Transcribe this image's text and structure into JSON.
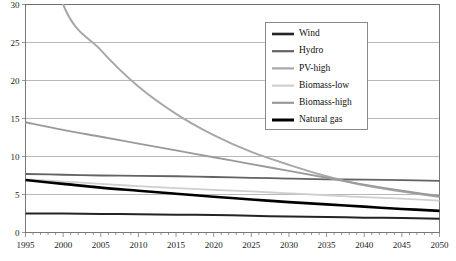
{
  "chart_data": {
    "type": "line",
    "title": "",
    "subtitle": "",
    "xlabel": "",
    "ylabel": "",
    "xlim": [
      1995,
      2050
    ],
    "ylim": [
      0,
      30
    ],
    "y_ticks": [
      0,
      5,
      10,
      15,
      20,
      25,
      30
    ],
    "x_ticks": [
      1995,
      2000,
      2005,
      2010,
      2015,
      2020,
      2025,
      2030,
      2035,
      2040,
      2045,
      2050
    ],
    "x_minor_tick_step": 1,
    "grid": "horizontal",
    "legend_position": "top-right",
    "x": [
      1995,
      2000,
      2005,
      2010,
      2015,
      2020,
      2025,
      2030,
      2035,
      2040,
      2045,
      2050
    ],
    "series": [
      {
        "name": "Wind",
        "color": "#242424",
        "width": 2.0,
        "values": [
          2.5,
          2.5,
          2.45,
          2.4,
          2.35,
          2.3,
          2.2,
          2.1,
          2.05,
          1.95,
          1.9,
          1.8
        ]
      },
      {
        "name": "Hydro",
        "color": "#636363",
        "width": 1.8,
        "values": [
          7.7,
          7.6,
          7.5,
          7.45,
          7.4,
          7.3,
          7.2,
          7.1,
          7.0,
          6.95,
          6.9,
          6.8
        ]
      },
      {
        "name": "PV-high",
        "color": "#a8a8a8",
        "width": 2.0,
        "values": [
          48.0,
          30.0,
          24.0,
          19.2,
          15.6,
          12.8,
          10.6,
          8.9,
          7.4,
          6.2,
          5.4,
          4.7
        ]
      },
      {
        "name": "Biomass-low",
        "color": "#cfcfcf",
        "width": 1.8,
        "values": [
          7.0,
          6.7,
          6.4,
          6.1,
          5.85,
          5.6,
          5.4,
          5.15,
          4.9,
          4.65,
          4.45,
          4.2
        ]
      },
      {
        "name": "Biomass-high",
        "color": "#9a9a9a",
        "width": 1.9,
        "values": [
          14.5,
          13.5,
          12.6,
          11.7,
          10.8,
          9.9,
          9.0,
          8.1,
          7.2,
          6.3,
          5.5,
          4.8
        ]
      },
      {
        "name": "Natural gas",
        "color": "#000000",
        "width": 2.6,
        "values": [
          6.9,
          6.4,
          5.9,
          5.5,
          5.1,
          4.7,
          4.35,
          4.0,
          3.7,
          3.4,
          3.1,
          2.85
        ]
      }
    ],
    "legend_entries": [
      {
        "label": "Wind",
        "color": "#242424",
        "width": 2.6
      },
      {
        "label": "Hydro",
        "color": "#636363",
        "width": 2.2
      },
      {
        "label": "PV-high",
        "color": "#a8a8a8",
        "width": 2.2
      },
      {
        "label": "Biomass-low",
        "color": "#cfcfcf",
        "width": 2.2
      },
      {
        "label": "Biomass-high",
        "color": "#9a9a9a",
        "width": 2.2
      },
      {
        "label": "Natural gas",
        "color": "#000000",
        "width": 3.0
      }
    ]
  },
  "axes": {
    "y_tick_labels": [
      "0",
      "5",
      "10",
      "15",
      "20",
      "25",
      "30"
    ],
    "x_tick_labels": [
      "1995",
      "2000",
      "2005",
      "2010",
      "2015",
      "2020",
      "2025",
      "2030",
      "2035",
      "2040",
      "2045",
      "2050"
    ]
  }
}
